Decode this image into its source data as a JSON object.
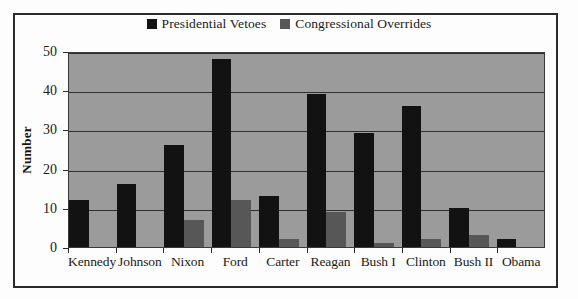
{
  "chart_data": {
    "type": "bar",
    "title": "",
    "xlabel": "",
    "ylabel": "Number",
    "ylim": [
      0,
      50
    ],
    "yticks": [
      "0",
      "10",
      "20",
      "30",
      "40",
      "50"
    ],
    "grid": true,
    "legend_position": "top-center",
    "plot_background": "#9b9b9b",
    "categories": [
      "Kennedy",
      "Johnson",
      "Nixon",
      "Ford",
      "Carter",
      "Reagan",
      "Bush I",
      "Clinton",
      "Bush II",
      "Obama"
    ],
    "series": [
      {
        "name": "Presidential Vetoes",
        "color": "#121212",
        "values": [
          12,
          16,
          26,
          48,
          13,
          39,
          29,
          36,
          10,
          2
        ]
      },
      {
        "name": "Congressional Overrides",
        "color": "#575757",
        "values": [
          0,
          0,
          7,
          12,
          2,
          9,
          1,
          2,
          3,
          0
        ]
      }
    ]
  },
  "legend": {
    "items": [
      {
        "label": "Presidential Vetoes",
        "color": "#121212",
        "swatch_icon": "square-swatch-icon"
      },
      {
        "label": "Congressional Overrides",
        "color": "#575757",
        "swatch_icon": "square-swatch-icon"
      }
    ]
  }
}
